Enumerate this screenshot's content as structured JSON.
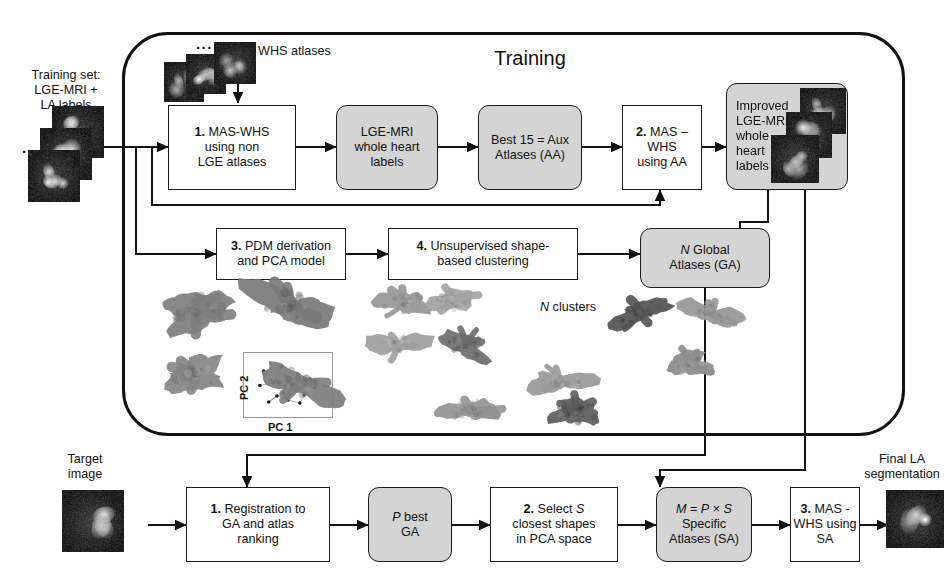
{
  "diagram": {
    "title": "Training",
    "training_section_label": "Training"
  },
  "labels": {
    "training_set": "Training set:\nLGE-MRI +\nLA labels",
    "whs_atlases": "WHS atlases",
    "n_clusters": "N clusters",
    "pc1": "PC 1",
    "pc2": "PC 2",
    "target_image": "Target\nimage",
    "final_segmentation": "Final LA\nsegmentation",
    "ellipsis": "..."
  },
  "training_boxes": [
    {
      "id": "mas-whs-non-lge",
      "num": "1.",
      "text": "MAS-WHS\nusing non\nLGE atlases",
      "shaded": false
    },
    {
      "id": "lge-mri-whole-heart-labels",
      "num": "",
      "text": "LGE-MRI\nwhole heart\nlabels",
      "shaded": true
    },
    {
      "id": "best-15-aux-atlases",
      "num": "",
      "text": "Best 15 = Aux\nAtlases (AA)",
      "shaded": true
    },
    {
      "id": "mas-whs-using-aa",
      "num": "2.",
      "text": "MAS – WHS\nusing AA",
      "shaded": false
    },
    {
      "id": "improved-lge-mri-labels",
      "num": "",
      "text": "Improved\nLGE-MRI\nwhole\nheart\nlabels",
      "shaded": true
    },
    {
      "id": "pdm-derivation-pca",
      "num": "3.",
      "text": "PDM derivation\nand PCA model",
      "shaded": false
    },
    {
      "id": "unsupervised-clustering",
      "num": "4.",
      "text": "Unsupervised shape-\nbased clustering",
      "shaded": false
    },
    {
      "id": "n-global-atlases",
      "num": "",
      "text": "N Global\nAtlases (GA)",
      "shaded": true
    }
  ],
  "inference_boxes": [
    {
      "id": "registration-ranking",
      "num": "1.",
      "text": "Registration to\nGA and atlas\nranking",
      "shaded": false
    },
    {
      "id": "p-best-ga",
      "num": "",
      "text": "P best\nGA",
      "shaded": true
    },
    {
      "id": "select-s-closest",
      "num": "2.",
      "text": "Select S\nclosest shapes\nin PCA space",
      "shaded": false
    },
    {
      "id": "specific-atlases",
      "num": "",
      "text": "M = P x S\nSpecific\nAtlases (SA)",
      "shaded": true
    },
    {
      "id": "mas-whs-using-sa",
      "num": "3.",
      "text": "MAS -\nWHS using\nSA",
      "shaded": false
    }
  ],
  "colors": {
    "shaded_fill": "#d4d4d4",
    "stroke": "#1b1b1b",
    "container_stroke": "#111111",
    "background": "#ffffff"
  },
  "chart_data": {
    "type": "scatter",
    "title": "",
    "xlabel": "PC 1",
    "ylabel": "PC 2",
    "grid": false,
    "legend": "none",
    "xlim": [
      0,
      1
    ],
    "ylim": [
      0,
      1
    ],
    "points": [
      {
        "x": 0.17,
        "y": 0.78
      },
      {
        "x": 0.41,
        "y": 0.86
      },
      {
        "x": 0.63,
        "y": 0.72
      },
      {
        "x": 0.12,
        "y": 0.49
      },
      {
        "x": 0.3,
        "y": 0.55
      },
      {
        "x": 0.47,
        "y": 0.48
      },
      {
        "x": 0.58,
        "y": 0.4
      },
      {
        "x": 0.8,
        "y": 0.62
      },
      {
        "x": 0.86,
        "y": 0.45
      },
      {
        "x": 0.35,
        "y": 0.28
      },
      {
        "x": 0.5,
        "y": 0.2
      },
      {
        "x": 0.66,
        "y": 0.14
      },
      {
        "x": 0.24,
        "y": 0.16
      },
      {
        "x": 0.44,
        "y": 0.34
      },
      {
        "x": 0.72,
        "y": 0.3
      }
    ],
    "edges": [
      [
        0,
        4
      ],
      [
        1,
        4
      ],
      [
        2,
        7
      ],
      [
        3,
        4
      ],
      [
        4,
        5
      ],
      [
        5,
        6
      ],
      [
        5,
        13
      ],
      [
        6,
        14
      ],
      [
        7,
        8
      ],
      [
        7,
        2
      ],
      [
        8,
        14
      ],
      [
        9,
        13
      ],
      [
        9,
        12
      ],
      [
        10,
        11
      ],
      [
        10,
        9
      ],
      [
        11,
        14
      ],
      [
        13,
        5
      ],
      [
        12,
        9
      ],
      [
        6,
        10
      ]
    ]
  }
}
